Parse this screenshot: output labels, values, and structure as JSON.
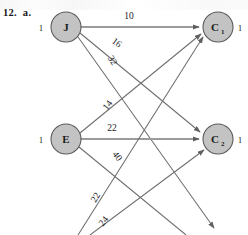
{
  "figure": {
    "problem_label": "12.  a.",
    "type": "bipartite-assignment-network",
    "supply_nodes": [
      {
        "id": "J",
        "label": "J",
        "sub": "",
        "supply": "1",
        "cx": 66,
        "cy": 27
      },
      {
        "id": "E",
        "label": "E",
        "sub": "",
        "supply": "1",
        "cx": 66,
        "cy": 139
      }
    ],
    "demand_nodes": [
      {
        "id": "C1",
        "label": "C",
        "sub": "1",
        "demand": "1",
        "cx": 218,
        "cy": 27
      },
      {
        "id": "C2",
        "label": "C",
        "sub": "2",
        "demand": "1",
        "cx": 218,
        "cy": 139
      }
    ],
    "edges": [
      {
        "from": "J",
        "to": "C1",
        "cost": "10",
        "lx": 129,
        "ly": 19,
        "rot": 0
      },
      {
        "from": "J",
        "to": "C2",
        "cost": "16",
        "lx": 115,
        "ly": 45,
        "rot": 36
      },
      {
        "from": "J",
        "to": "C3",
        "cost": "32",
        "lx": 110,
        "ly": 62,
        "rot": 58
      },
      {
        "from": "E",
        "to": "C1",
        "cost": "14",
        "lx": 110,
        "ly": 107,
        "rot": -52
      },
      {
        "from": "E",
        "to": "C2",
        "cost": "22",
        "lx": 112,
        "ly": 131,
        "rot": 0
      },
      {
        "from": "E",
        "to": "C3",
        "cost": "40",
        "lx": 115,
        "ly": 158,
        "rot": 52
      },
      {
        "from": "B",
        "to": "C1",
        "cost": "22",
        "lx": 98,
        "ly": 199,
        "rot": -58
      },
      {
        "from": "B",
        "to": "C2",
        "cost": "24",
        "lx": 106,
        "ly": 223,
        "rot": -52
      }
    ],
    "node_fill_color": "#c3c3c3",
    "node_stroke_color": "#5a5a5a",
    "edge_color": "#6e6e6e",
    "text_color": "#1b1b1b",
    "background_color": "#ffffff"
  }
}
